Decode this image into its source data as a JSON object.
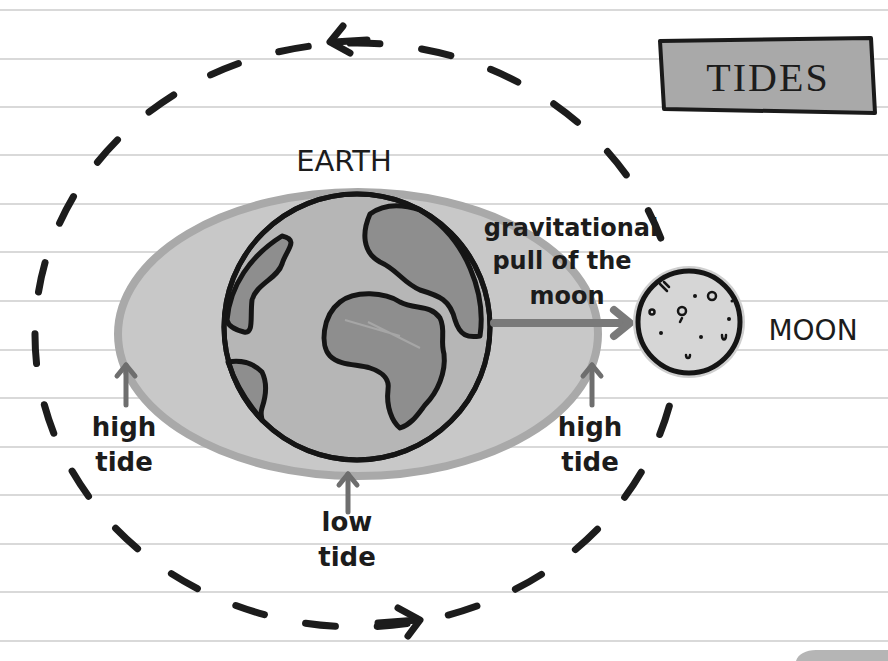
{
  "diagram": {
    "title": "TIDES",
    "labels": {
      "earth": "EARTH",
      "moon": "MOON",
      "pull_line1": "gravitational",
      "pull_line2": "pull of the",
      "pull_line3": "moon",
      "high_tide_left_1": "high",
      "high_tide_left_2": "tide",
      "high_tide_right_1": "high",
      "high_tide_right_2": "tide",
      "low_tide_1": "low",
      "low_tide_2": "tide"
    },
    "nodes": [
      {
        "id": "earth",
        "label": "EARTH"
      },
      {
        "id": "moon",
        "label": "MOON"
      },
      {
        "id": "water-bulge",
        "label": ""
      }
    ],
    "edges": [
      {
        "from": "moon",
        "to": "earth",
        "label": "gravitational pull of the moon"
      },
      {
        "from": "high_tide_left",
        "to": "water-bulge",
        "label": "high tide"
      },
      {
        "from": "high_tide_right",
        "to": "water-bulge",
        "label": "high tide"
      },
      {
        "from": "low_tide",
        "to": "water-bulge",
        "label": "low tide"
      }
    ],
    "orbit": {
      "style": "dashed",
      "direction": "counter-clockwise"
    },
    "colors": {
      "ink": "#1c1c1c",
      "paper": "#ffffff",
      "rule_line": "#c8c8c8",
      "water_fill": "#c6c6c6",
      "water_edge": "#a9a9a9",
      "earth_ocean": "#b3b3b3",
      "earth_land": "#8f8f8f",
      "moon_fill": "#d2d2d2",
      "arrow_gray": "#777777",
      "title_fill": "#a8a8a8"
    }
  }
}
